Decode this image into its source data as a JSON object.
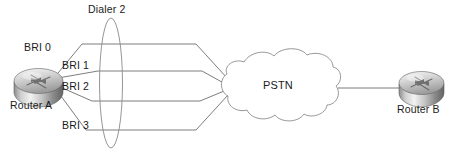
{
  "diagram": {
    "type": "network-topology",
    "nodes": {
      "router_a": {
        "label": "Router A",
        "icon": "router-icon",
        "x": 38,
        "y": 82
      },
      "router_b": {
        "label": "Router B",
        "icon": "router-icon",
        "x": 420,
        "y": 82
      },
      "pstn_cloud": {
        "label": "PSTN",
        "icon": "cloud-icon",
        "x": 281,
        "y": 86
      },
      "dialer_group": {
        "label": "Dialer 2",
        "icon": "ellipse-grouping-icon",
        "x": 111,
        "y": 83
      }
    },
    "interfaces": [
      {
        "label": "BRI 0"
      },
      {
        "label": "BRI 1"
      },
      {
        "label": "BRI 2"
      },
      {
        "label": "BRI 3"
      }
    ],
    "links": [
      {
        "from": "router_a",
        "to": "pstn_cloud",
        "interface": "BRI 0"
      },
      {
        "from": "router_a",
        "to": "pstn_cloud",
        "interface": "BRI 1"
      },
      {
        "from": "router_a",
        "to": "pstn_cloud",
        "interface": "BRI 2"
      },
      {
        "from": "router_a",
        "to": "pstn_cloud",
        "interface": "BRI 3"
      },
      {
        "from": "pstn_cloud",
        "to": "router_b",
        "interface": ""
      }
    ],
    "colors": {
      "background": "#ffffff",
      "line": "#6e6e6e",
      "text": "#1a1a1a",
      "router_body_light": "#f0f0f0",
      "router_body_mid": "#b6b6b6",
      "router_body_dark": "#6a6a6a",
      "cloud_stroke": "#888888"
    }
  }
}
